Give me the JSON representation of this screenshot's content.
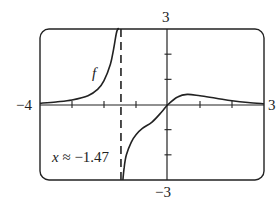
{
  "chart_data": {
    "type": "line",
    "title": "",
    "xlabel": "",
    "ylabel": "",
    "xlim": [
      -4,
      3
    ],
    "ylim": [
      -3,
      3
    ],
    "grid": false,
    "legend": "none",
    "x_tick_labels": [
      "-4",
      "3"
    ],
    "y_tick_labels": [
      "3",
      "-3"
    ],
    "x_ticks": [
      -3,
      -2,
      -1,
      1,
      2
    ],
    "y_ticks": [
      -2,
      -1,
      1,
      2
    ],
    "series": [
      {
        "name": "f",
        "branch": "left",
        "x": [
          -4,
          -3.5,
          -3,
          -2.5,
          -2.2,
          -2.0,
          -1.8,
          -1.7,
          -1.62,
          -1.57,
          -1.53
        ],
        "y": [
          0.05,
          0.1,
          0.18,
          0.35,
          0.6,
          0.95,
          1.6,
          2.2,
          2.8,
          3.0,
          3.0
        ]
      },
      {
        "name": "f",
        "branch": "right",
        "x": [
          -1.41,
          -1.37,
          -1.3,
          -1.15,
          -1.0,
          -0.8,
          -0.5,
          -0.2,
          0,
          0.3,
          0.6,
          1.0,
          1.5,
          2.0,
          2.5,
          3.0
        ],
        "y": [
          -3.0,
          -2.5,
          -2.0,
          -1.5,
          -1.2,
          -0.95,
          -0.7,
          -0.3,
          0.0,
          0.3,
          0.4,
          0.35,
          0.25,
          0.15,
          0.08,
          0.03
        ]
      }
    ],
    "asymptote": {
      "x": -1.47,
      "style": "dashed"
    },
    "annotations": [
      {
        "text": "f",
        "x": -2.1,
        "y": 1.3,
        "style": "italic"
      },
      {
        "text": "x ≈ −1.47",
        "x": -3.3,
        "y": -2.1
      }
    ]
  },
  "labels": {
    "x_min": "−4",
    "x_max": "3",
    "y_max": "3",
    "y_min": "−3",
    "curve_name": "f",
    "asymptote_var": "x",
    "asymptote_eq": " ≈ −1.47"
  }
}
